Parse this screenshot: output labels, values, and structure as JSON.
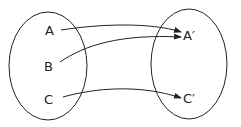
{
  "diagram": {
    "type": "mapping",
    "domain_set": {
      "elements": [
        "A",
        "B",
        "C"
      ]
    },
    "codomain_set": {
      "elements": [
        "A′",
        "C′"
      ]
    },
    "mappings": [
      {
        "from": "A",
        "to": "A′"
      },
      {
        "from": "B",
        "to": "A′"
      },
      {
        "from": "C",
        "to": "C′"
      }
    ],
    "stroke_color": "#222222"
  }
}
